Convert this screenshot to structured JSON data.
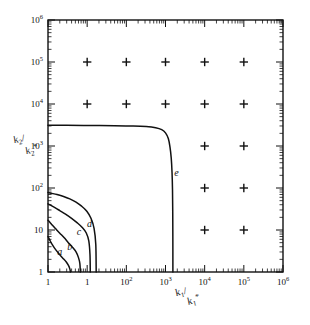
{
  "figure": {
    "background_color": "#ffffff",
    "ink_color": "#111111",
    "width": 310,
    "height": 325
  },
  "chart_data": {
    "type": "line",
    "title": "",
    "subtitle": "",
    "xlabel": "k1/k1*",
    "ylabel": "k2/k2*",
    "xlabel_parts": {
      "num_base": "k",
      "num_sub": "1",
      "den_base": "k",
      "den_sub": "1",
      "den_star": "*"
    },
    "ylabel_parts": {
      "num_base": "k",
      "num_sub": "2",
      "den_base": "k",
      "den_sub": "2",
      "den_star": "*"
    },
    "xscale": "log",
    "yscale": "log",
    "xlim": [
      1,
      1000000
    ],
    "ylim": [
      1,
      1000000
    ],
    "grid": false,
    "legend_position": "inline-curve-labels",
    "xticklabels": [
      "1",
      "10",
      "10^2",
      "10^3",
      "10^4",
      "10^5",
      "10^6"
    ],
    "yticklabels": [
      "1",
      "10",
      "10^2",
      "10^3",
      "10^4",
      "10^5",
      "10^6"
    ],
    "xtick_mantissas": [
      "1",
      "1",
      "10",
      "10",
      "10",
      "10",
      "10"
    ],
    "xtick_exponents": [
      "",
      "",
      "2",
      "3",
      "4",
      "5",
      "6"
    ],
    "ytick_mantissas": [
      "1",
      "10",
      "10",
      "10",
      "10",
      "10",
      "10"
    ],
    "ytick_exponents": [
      "",
      "",
      "2",
      "3",
      "4",
      "5",
      "6"
    ],
    "xtick_values": [
      1,
      10,
      100,
      1000,
      10000,
      100000,
      1000000
    ],
    "ytick_values": [
      1,
      10,
      100,
      1000,
      10000,
      100000,
      1000000
    ],
    "series": [
      {
        "name": "a",
        "label": "a",
        "label_x": 2.0,
        "label_y": 2.6,
        "points": [
          [
            1.0,
            7.0
          ],
          [
            1.05,
            6.4
          ],
          [
            1.15,
            5.4
          ],
          [
            1.3,
            4.4
          ],
          [
            1.5,
            3.6
          ],
          [
            1.8,
            2.9
          ],
          [
            2.1,
            2.45
          ],
          [
            2.5,
            2.05
          ],
          [
            2.9,
            1.75
          ],
          [
            3.3,
            1.45
          ],
          [
            3.6,
            1.2
          ],
          [
            3.75,
            1.0
          ]
        ]
      },
      {
        "name": "b",
        "label": "b",
        "label_x": 3.6,
        "label_y": 3.4,
        "points": [
          [
            1.0,
            17.0
          ],
          [
            1.1,
            15.5
          ],
          [
            1.3,
            13.0
          ],
          [
            1.6,
            10.5
          ],
          [
            2.0,
            8.4
          ],
          [
            2.6,
            6.5
          ],
          [
            3.3,
            5.0
          ],
          [
            4.2,
            3.9
          ],
          [
            5.2,
            3.0
          ],
          [
            6.0,
            2.2
          ],
          [
            6.5,
            1.6
          ],
          [
            6.7,
            1.0
          ]
        ]
      },
      {
        "name": "c",
        "label": "c",
        "label_x": 6.2,
        "label_y": 7.6,
        "points": [
          [
            1.0,
            42.0
          ],
          [
            1.15,
            39.0
          ],
          [
            1.5,
            34.0
          ],
          [
            2.0,
            29.0
          ],
          [
            2.8,
            24.0
          ],
          [
            4.0,
            19.0
          ],
          [
            5.5,
            15.0
          ],
          [
            7.5,
            11.5
          ],
          [
            9.5,
            8.5
          ],
          [
            11.0,
            5.5
          ],
          [
            11.8,
            2.6
          ],
          [
            12.0,
            1.0
          ]
        ]
      },
      {
        "name": "d",
        "label": "d",
        "label_x": 11.5,
        "label_y": 11.5,
        "points": [
          [
            1.0,
            78.0
          ],
          [
            1.2,
            75.0
          ],
          [
            1.7,
            70.0
          ],
          [
            2.5,
            63.0
          ],
          [
            3.6,
            55.0
          ],
          [
            5.2,
            46.0
          ],
          [
            7.2,
            37.0
          ],
          [
            9.8,
            28.0
          ],
          [
            12.5,
            19.0
          ],
          [
            15.0,
            11.0
          ],
          [
            16.6,
            4.5
          ],
          [
            17.0,
            1.0
          ]
        ]
      },
      {
        "name": "e",
        "label": "e",
        "label_x": 1900.0,
        "label_y": 190.0,
        "points": [
          [
            1.0,
            3100.0
          ],
          [
            3.0,
            3100.0
          ],
          [
            12.0,
            3080.0
          ],
          [
            50.0,
            3050.0
          ],
          [
            150.0,
            3000.0
          ],
          [
            320.0,
            2900.0
          ],
          [
            560.0,
            2720.0
          ],
          [
            800.0,
            2450.0
          ],
          [
            1000.0,
            2050.0
          ],
          [
            1180.0,
            1500.0
          ],
          [
            1300.0,
            950.0
          ],
          [
            1400.0,
            520.0
          ],
          [
            1470.0,
            230.0
          ],
          [
            1510.0,
            90.0
          ],
          [
            1530.0,
            28.0
          ],
          [
            1540.0,
            7.0
          ],
          [
            1545.0,
            1.0
          ]
        ]
      }
    ],
    "markers": {
      "symbol": "+",
      "symbol_name": "plus-marker",
      "points": [
        [
          10,
          100000
        ],
        [
          100,
          100000
        ],
        [
          1000,
          100000
        ],
        [
          10000,
          100000
        ],
        [
          100000,
          100000
        ],
        [
          10,
          10000
        ],
        [
          100,
          10000
        ],
        [
          1000,
          10000
        ],
        [
          10000,
          10000
        ],
        [
          100000,
          10000
        ],
        [
          10000,
          1000
        ],
        [
          100000,
          1000
        ],
        [
          10000,
          100
        ],
        [
          100000,
          100
        ],
        [
          10000,
          10
        ],
        [
          100000,
          10
        ]
      ]
    },
    "annotations": [
      {
        "text": "a",
        "x": 2.0,
        "y": 2.6
      },
      {
        "text": "b",
        "x": 3.6,
        "y": 3.4
      },
      {
        "text": "c",
        "x": 6.2,
        "y": 7.6
      },
      {
        "text": "d",
        "x": 11.5,
        "y": 11.5
      },
      {
        "text": "e",
        "x": 1900.0,
        "y": 190.0
      }
    ]
  }
}
